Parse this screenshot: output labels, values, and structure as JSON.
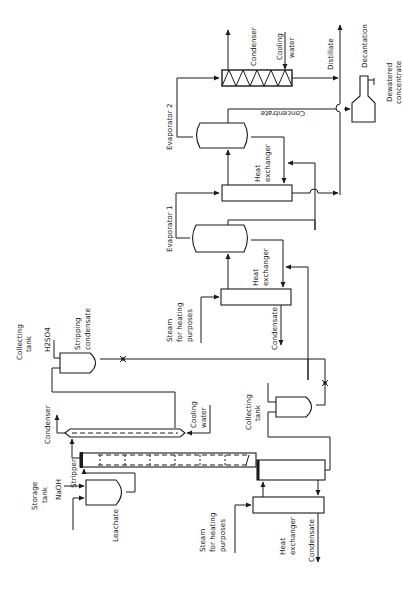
{
  "diagram": {
    "orientation": "rotated-90-clockwise",
    "labels": {
      "leachate": "Leachate",
      "storage_tank_line1": "Storage",
      "storage_tank_line2": "tank",
      "naoh": "NaOH",
      "stripper": "Stripper",
      "condenser_1": "Condenser",
      "cooling_water_1_line1": "Cooling",
      "cooling_water_1_line2": "water",
      "collecting_tank_1_line1": "Collecting",
      "collecting_tank_1_line2": "tank",
      "h2so4": "H2SO4",
      "stripping_condensate_line1": "Stripping",
      "stripping_condensate_line2": "condensate",
      "collecting_tank_2_line1": "Collecting",
      "collecting_tank_2_line2": "tank",
      "steam_1_line1": "Steam",
      "steam_1_line2": "for heating",
      "steam_1_line3": "purposes",
      "heat_exchanger_1_line1": "Heat",
      "heat_exchanger_1_line2": "exchanger",
      "condensate_1": "Condensate",
      "steam_2_line1": "Steam",
      "steam_2_line2": "for heating",
      "steam_2_line3": "purposes",
      "heat_exchanger_2_line1": "Heat",
      "heat_exchanger_2_line2": "exchanger",
      "condensate_2": "Condensate",
      "evaporator_1": "Evaporator 1",
      "heat_exchanger_3_line1": "Heat",
      "heat_exchanger_3_line2": "exchanger",
      "evaporator_2": "Evaporator 2",
      "concentrate": "Concentrate",
      "condenser_2": "Condenser",
      "cooling_water_2_line1": "Cooling",
      "cooling_water_2_line2": "water",
      "distillate": "Distillate",
      "decantation": "Decantation",
      "dewatered_line1": "Dewatered",
      "dewatered_line2": "concentrate"
    },
    "units": [
      "Storage tank",
      "Stripper",
      "Condenser",
      "Collecting tank (stripping condensate)",
      "Collecting tank",
      "Heat exchanger",
      "Heat exchanger (Evaporator 1)",
      "Evaporator 1",
      "Heat exchanger (Evaporator 2)",
      "Evaporator 2",
      "Condenser (zigzag)",
      "Decantation"
    ],
    "streams": [
      "Leachate",
      "NaOH",
      "H2SO4",
      "Cooling water",
      "Steam for heating purposes",
      "Condensate",
      "Stripping condensate",
      "Concentrate",
      "Distillate",
      "Dewatered concentrate"
    ]
  }
}
